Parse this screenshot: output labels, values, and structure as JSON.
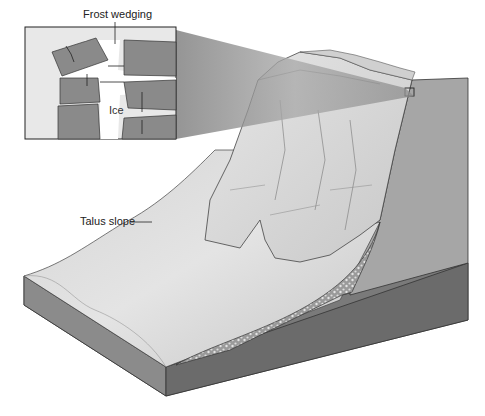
{
  "diagram": {
    "labels": {
      "frost_wedging": "Frost wedging",
      "ice": "Ice",
      "talus_slope": "Talus slope"
    },
    "inset": {
      "description": "Magnified view of rock joints with ice wedging blocks apart"
    },
    "colors": {
      "rock_block": "#8a8a8a",
      "cliff_face": "#d8d8d8",
      "cliff_side": "#a5a5a5",
      "base_front": "#7a7a7a",
      "base_side": "#6a6a6a",
      "talus_surface": "#cfcfcf",
      "background": "#ffffff"
    }
  }
}
